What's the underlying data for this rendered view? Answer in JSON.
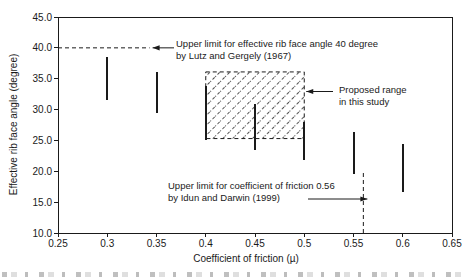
{
  "figure": {
    "colors": {
      "ink": "#1a1a1a",
      "hatch": "#3a3a3a",
      "background": "#ffffff"
    },
    "y_axis": {
      "label": "Effective rib face angle (degree)",
      "tick_labels": [
        "45.0",
        "40.0",
        "35.0",
        "30.0",
        "25.0",
        "20.0",
        "15.0",
        "10.0"
      ]
    },
    "x_axis": {
      "label": "Coefficient of friction (µ)",
      "tick_labels": [
        "0.25",
        "0.3",
        "0.35",
        "0.4",
        "0.45",
        "0.5",
        "0.55",
        "0.6",
        "0.65"
      ]
    },
    "annotations": {
      "upper_angle_line1": "Upper limit for effective rib face angle 40 degree",
      "upper_angle_line2": "by Lutz and Gergely (1967)",
      "proposed_line1": "Proposed range",
      "proposed_line2": "in this study",
      "friction_line1": "Upper limit for coefficient of friction 0.56",
      "friction_line2": "by Idun and Darwin (1999)"
    }
  },
  "chart_data": {
    "type": "scatter",
    "subtype": "vertical-range-bars",
    "title": "",
    "xlabel": "Coefficient of friction (µ)",
    "ylabel": "Effective rib face angle (degree)",
    "xlim": [
      0.25,
      0.65
    ],
    "ylim": [
      10,
      45
    ],
    "x_ticks": [
      0.25,
      0.3,
      0.35,
      0.4,
      0.45,
      0.5,
      0.55,
      0.6,
      0.65
    ],
    "y_ticks": [
      45,
      40,
      35,
      30,
      25,
      20,
      15,
      10
    ],
    "grid": false,
    "legend": "none",
    "series": [
      {
        "name": "measured effective rib face angle ranges",
        "points": [
          {
            "x": 0.3,
            "y_low": 31.6,
            "y_high": 38.5
          },
          {
            "x": 0.35,
            "y_low": 29.4,
            "y_high": 36.1
          },
          {
            "x": 0.4,
            "y_low": 25.1,
            "y_high": 33.9
          },
          {
            "x": 0.45,
            "y_low": 23.4,
            "y_high": 30.9
          },
          {
            "x": 0.5,
            "y_low": 21.8,
            "y_high": 28.0
          },
          {
            "x": 0.55,
            "y_low": 19.6,
            "y_high": 26.3
          },
          {
            "x": 0.6,
            "y_low": 16.6,
            "y_high": 24.5
          }
        ]
      }
    ],
    "reference_lines": [
      {
        "kind": "horizontal-dashed",
        "y": 40,
        "x_start": 0.25,
        "x_end": 0.343,
        "label": "Upper limit for effective rib face angle 40 degree by Lutz and Gergely (1967)"
      },
      {
        "kind": "vertical-dashed",
        "x": 0.56,
        "y_start": 10,
        "y_end": 20,
        "label": "Upper limit for coefficient of friction 0.56 by Idun and Darwin (1999)"
      }
    ],
    "regions": [
      {
        "kind": "hatched-rect",
        "x_range": [
          0.4,
          0.5
        ],
        "y_range": [
          25.3,
          36.1
        ],
        "label": "Proposed range in this study"
      }
    ]
  }
}
